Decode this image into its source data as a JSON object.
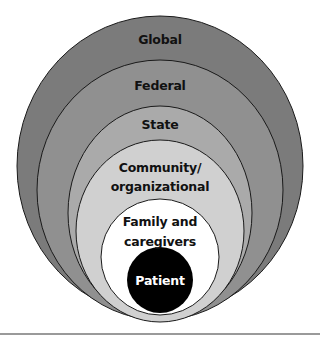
{
  "diagram": {
    "type": "nested-concentric-ellipses",
    "levels": [
      {
        "id": "global",
        "label_lines": [
          "Global"
        ],
        "fill": "#7b7b7b",
        "text_color": "#111111"
      },
      {
        "id": "federal",
        "label_lines": [
          "Federal"
        ],
        "fill": "#909090",
        "text_color": "#111111"
      },
      {
        "id": "state",
        "label_lines": [
          "State"
        ],
        "fill": "#aaaaaa",
        "text_color": "#111111"
      },
      {
        "id": "community",
        "label_lines": [
          "Community/",
          "organizational"
        ],
        "fill": "#d0d0d0",
        "text_color": "#111111"
      },
      {
        "id": "family",
        "label_lines": [
          "Family and",
          "caregivers"
        ],
        "fill": "#ffffff",
        "text_color": "#111111"
      },
      {
        "id": "patient",
        "label_lines": [
          "Patient"
        ],
        "fill": "#000000",
        "text_color": "#ffffff"
      }
    ],
    "outline_color": "#1a1a1a",
    "rule_color": "#9a9a9a"
  }
}
